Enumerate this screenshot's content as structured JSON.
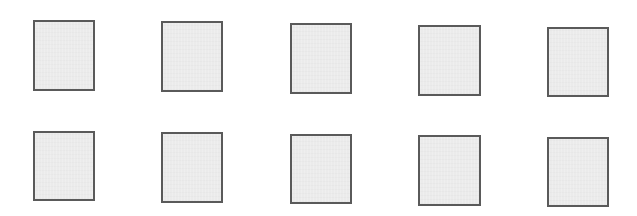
{
  "page": {
    "background": "#ffffff",
    "box_fill": "#ebebeb",
    "box_border": "#5a5a5a"
  },
  "rows": [
    {
      "boxes": [
        {
          "x": 33,
          "y": 20,
          "w": 62,
          "h": 71
        },
        {
          "x": 161,
          "y": 21,
          "w": 62,
          "h": 71
        },
        {
          "x": 290,
          "y": 23,
          "w": 62,
          "h": 71
        },
        {
          "x": 418,
          "y": 25,
          "w": 63,
          "h": 71
        },
        {
          "x": 547,
          "y": 27,
          "w": 62,
          "h": 70
        }
      ]
    },
    {
      "boxes": [
        {
          "x": 33,
          "y": 131,
          "w": 62,
          "h": 70
        },
        {
          "x": 161,
          "y": 132,
          "w": 62,
          "h": 71
        },
        {
          "x": 290,
          "y": 134,
          "w": 62,
          "h": 70
        },
        {
          "x": 418,
          "y": 135,
          "w": 63,
          "h": 71
        },
        {
          "x": 547,
          "y": 137,
          "w": 62,
          "h": 70
        }
      ]
    }
  ]
}
